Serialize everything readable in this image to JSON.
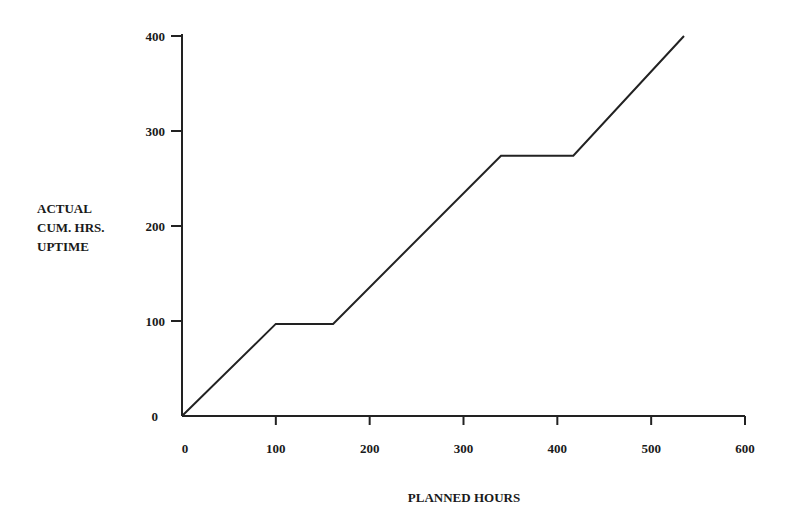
{
  "chart_data": {
    "type": "line",
    "title": "",
    "xlabel": "PLANNED HOURS",
    "ylabel": [
      "ACTUAL",
      "CUM. HRS.",
      "UPTIME"
    ],
    "xlim": [
      0,
      600
    ],
    "ylim": [
      0,
      400
    ],
    "x_ticks": [
      0,
      100,
      200,
      300,
      400,
      500,
      600
    ],
    "y_ticks": [
      0,
      100,
      200,
      300,
      400
    ],
    "grid": false,
    "legend": null,
    "series": [
      {
        "name": "Actual cumulative uptime",
        "x": [
          0,
          100,
          161,
          340,
          417,
          535
        ],
        "y": [
          0,
          97,
          97,
          274,
          274,
          400
        ]
      }
    ],
    "line_color": "#222222"
  },
  "axes": {
    "x_label": "PLANNED HOURS",
    "y_label_lines": [
      "ACTUAL",
      "CUM. HRS.",
      "UPTIME"
    ]
  }
}
